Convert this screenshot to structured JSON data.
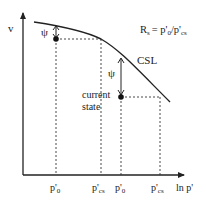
{
  "diagram": {
    "title_formula": "R",
    "formula": {
      "lhs": "R",
      "lhs_sub": "s",
      "rhs": "= p'",
      "rhs_sub1": "0",
      "slash": "/p'",
      "rhs_sub2": "cs"
    },
    "y_axis_label": "v",
    "x_axis_label": "ln p'",
    "curve_label": "CSL",
    "state_label_line1": "current",
    "state_label_line2": "state",
    "psi_label": "ψ",
    "x_ticks": [
      {
        "main": "p'",
        "sub": "0"
      },
      {
        "main": "p'",
        "sub": "cs"
      },
      {
        "main": "p'",
        "sub": "0"
      },
      {
        "main": "p'",
        "sub": "cs"
      }
    ],
    "colors": {
      "line": "#222222",
      "dash": "#333333",
      "background": "#ffffff"
    }
  }
}
